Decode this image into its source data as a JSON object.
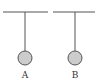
{
  "diagram": {
    "type": "physics-pendulum",
    "colors": {
      "line": "#555555",
      "ball_fill": "#cccccc",
      "ball_stroke": "#555555",
      "label": "#333333"
    },
    "pendulums": [
      {
        "label": "A",
        "ceiling_x1": 3,
        "ceiling_x2": 48,
        "ceiling_y": 12,
        "string_x": 25,
        "ball_cy": 58,
        "ball_r": 7
      },
      {
        "label": "B",
        "ceiling_x1": 53,
        "ceiling_x2": 95,
        "ceiling_y": 12,
        "string_x": 75,
        "ball_cy": 58,
        "ball_r": 7
      }
    ]
  }
}
